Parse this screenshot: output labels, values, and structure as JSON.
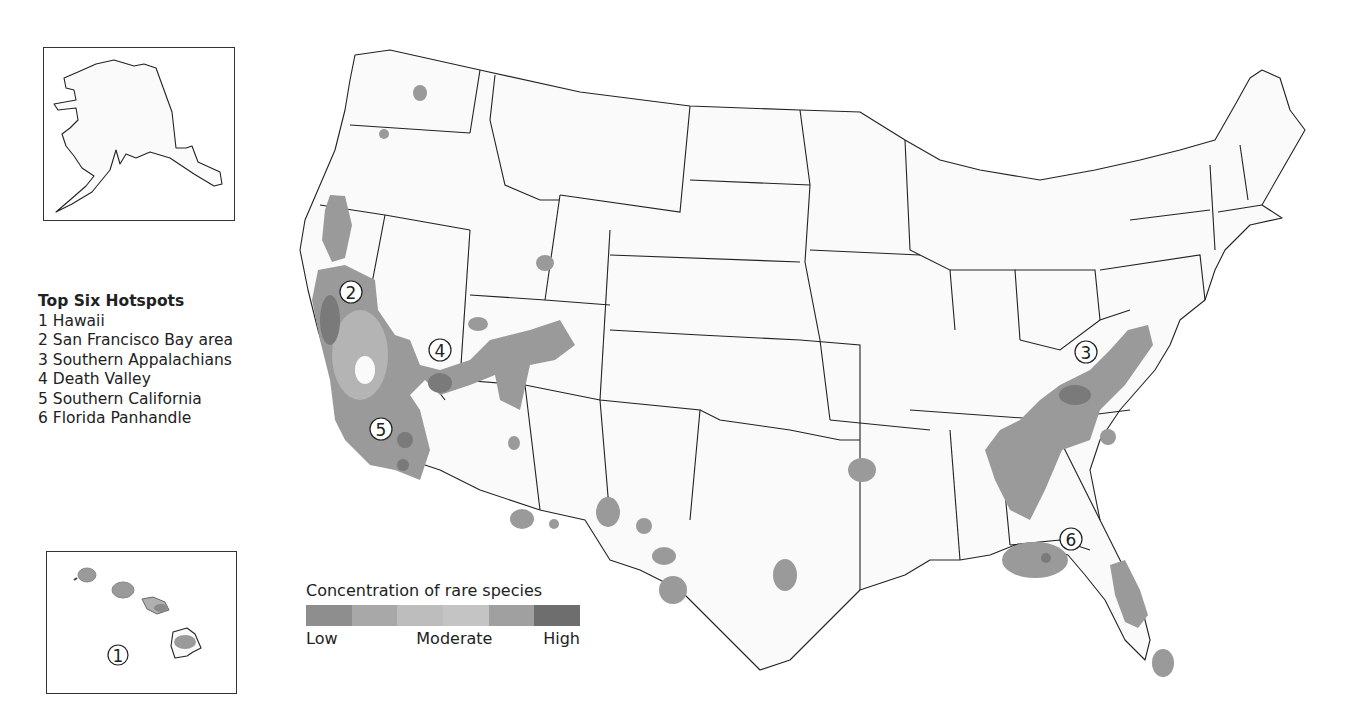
{
  "legend": {
    "title": "Top Six Hotspots",
    "items": [
      {
        "num": "1",
        "label": "1 Hawaii"
      },
      {
        "num": "2",
        "label": "2 San Francisco Bay area"
      },
      {
        "num": "3",
        "label": "3 Southern Appalachians"
      },
      {
        "num": "4",
        "label": "4 Death Valley"
      },
      {
        "num": "5",
        "label": "5 Southern California"
      },
      {
        "num": "6",
        "label": "6 Florida Panhandle"
      }
    ]
  },
  "concentration_legend": {
    "title": "Concentration of rare species",
    "low_label": "Low",
    "moderate_label": "Moderate",
    "high_label": "High",
    "swatches": [
      "#8e8e8e",
      "#a8a8a8",
      "#bdbdbd",
      "#c4c4c4",
      "#a0a0a0",
      "#6e6e6e"
    ]
  },
  "markers": {
    "m1": "1",
    "m2": "2",
    "m3": "3",
    "m4": "4",
    "m5": "5",
    "m6": "6"
  },
  "insets": {
    "alaska": "Alaska",
    "hawaii": "Hawaii"
  }
}
